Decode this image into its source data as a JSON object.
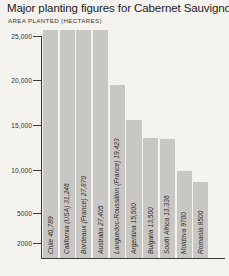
{
  "chart_data": {
    "type": "bar",
    "title": "Major planting figures for Cabernet Sauvignon",
    "subtitle": "AREA PLANTED (HECTARES)",
    "xlabel": "",
    "ylabel": "AREA PLANTED (HECTARES)",
    "ylim": [
      0,
      26500
    ],
    "grid": false,
    "legend": null,
    "ytick_labels": [
      "25,000",
      "20,000",
      "15,000",
      "10,000",
      "5000",
      "2000"
    ],
    "ytick_values": [
      25000,
      20000,
      15000,
      10000,
      5000,
      2000
    ],
    "categories": [
      "Chile",
      "California (USA)",
      "Bordeaux (France)",
      "Australia",
      "Languedoc-Roussillon (France)",
      "Argentina",
      "Bulgaria",
      "South Africa",
      "Moldova",
      "Romania"
    ],
    "values": [
      40789,
      31246,
      27870,
      27405,
      19423,
      15500,
      13500,
      13336,
      9700,
      8500
    ],
    "bar_labels": [
      "Chile 40,789",
      "California (USA) 31,246",
      "Bordeaux (France) 27,870",
      "Australia 27,405",
      "Languedoc-Roussillon (France) 19,423",
      "Argentina 15,500",
      "Bulgaria 13,500",
      "South Africa 13,336",
      "Moldova 9700",
      "Romania 8500"
    ],
    "colors": {
      "bar": "#c9c7c4",
      "axis": "#3d3a37",
      "background": "#f5f3ef",
      "text": "#2b2b2b"
    }
  }
}
